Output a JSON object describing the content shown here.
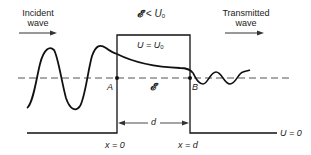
{
  "labels": {
    "incident_line1": "Incident",
    "incident_line2": "wave",
    "transmitted_line1": "Transmitted",
    "transmitted_line2": "wave",
    "condition_E": "𝓔",
    "condition_op": " < U",
    "condition_sub": "0",
    "barrier_U": "U = U",
    "barrier_sub": "0",
    "point_A": "A",
    "point_B": "B",
    "energy_E": "𝓔",
    "width_d": "d",
    "x_zero": "x = 0",
    "x_d": "x = d",
    "floor_U": "U = 0"
  },
  "geometry": {
    "axis_y": 78,
    "barrier_left_x": 117,
    "barrier_right_x": 190,
    "barrier_top_y": 35,
    "floor_y": 133,
    "floor_left_x": 27,
    "floor_right_x": 277
  },
  "colors": {
    "line": "#111111",
    "dashed": "#555555",
    "text": "#222222"
  }
}
